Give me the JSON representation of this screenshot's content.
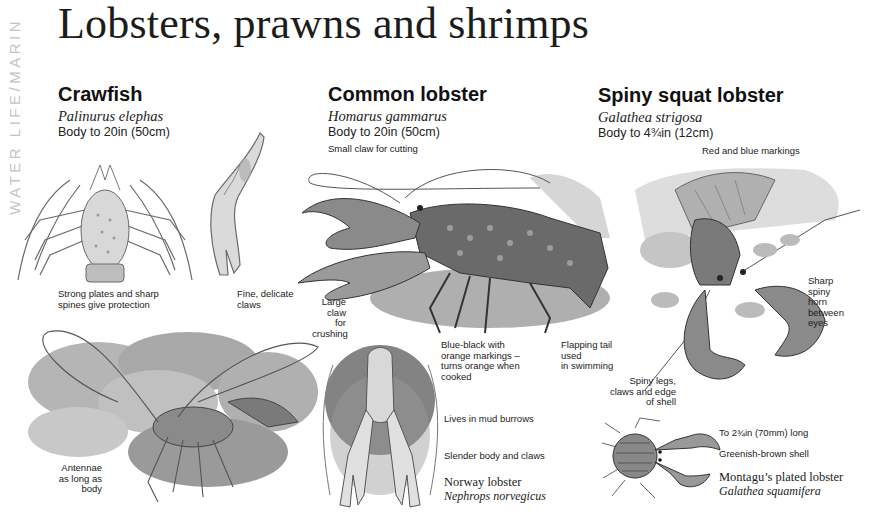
{
  "side_tab": "WATER LIFE/MARIN",
  "page_title": "Lobsters, prawns and shrimps",
  "species": [
    {
      "name": "Crawfish",
      "latin": "Palinurus elephas",
      "size": "Body to 20in (50cm)",
      "notes": [
        "Strong plates and sharp\nspines give protection",
        "Fine, delicate\nclaws",
        "Antennae\nas long as\nbody"
      ]
    },
    {
      "name": "Common lobster",
      "latin": "Homarus gammarus",
      "size": "Body to 20in (50cm)",
      "notes": [
        "Small claw for cutting",
        "Large\nclaw\nfor\ncrushing",
        "Blue-black with\norange markings –\nturns orange when\ncooked",
        "Flapping tail\nused\nin swimming"
      ]
    },
    {
      "name": "Spiny squat lobster",
      "latin": "Galathea strigosa",
      "size": "Body to 4¾in (12cm)",
      "notes": [
        "Red and blue markings",
        "Sharp\nspiny\nhorn\nbetween\neyes",
        "Spiny legs,\nclaws and edge\nof shell"
      ]
    }
  ],
  "norway_lobster": {
    "notes": [
      "Lives in mud burrows",
      "Slender body and claws"
    ],
    "name": "Norway lobster",
    "latin": "Nephrops norvegicus"
  },
  "montagu": {
    "notes": [
      "To 2¾in (70mm) long",
      "Greenish-brown shell"
    ],
    "name": "Montagu’s plated lobster",
    "latin": "Galathea squamifera"
  },
  "colors": {
    "text": "#1a1a1a",
    "side_tab": "#c4c4c4",
    "illustration_dark": "#3a3a3a",
    "illustration_mid": "#8a8a8a",
    "illustration_light": "#d4d4d4"
  }
}
